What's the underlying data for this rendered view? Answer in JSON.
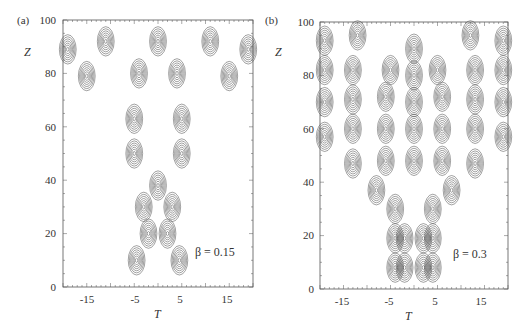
{
  "chart_data": [
    {
      "type": "contour",
      "panel_label": "(a)",
      "title": "",
      "xlabel": "T",
      "ylabel": "Z",
      "xlim": [
        -20,
        20
      ],
      "ylim": [
        0,
        100
      ],
      "xticks": [
        -15,
        -5,
        5,
        15
      ],
      "yticks": [
        0,
        20,
        40,
        60,
        80,
        100
      ],
      "grid": false,
      "annotation": "β = 0.15",
      "notes": "No contour levels or colorbar are shown. Peak locations below are approximate visual estimates; the underlying field values are not readable from the image.",
      "peaks_estimated": [
        {
          "T": -4.5,
          "Z": 10
        },
        {
          "T": -2,
          "Z": 20
        },
        {
          "T": 2,
          "Z": 20
        },
        {
          "T": 4.5,
          "Z": 10
        },
        {
          "T": -3,
          "Z": 30
        },
        {
          "T": 3,
          "Z": 30
        },
        {
          "T": 0,
          "Z": 38
        },
        {
          "T": -5,
          "Z": 50
        },
        {
          "T": 5,
          "Z": 50
        },
        {
          "T": -5,
          "Z": 63
        },
        {
          "T": 5,
          "Z": 63
        },
        {
          "T": -4,
          "Z": 80
        },
        {
          "T": 4,
          "Z": 80
        },
        {
          "T": -15,
          "Z": 79
        },
        {
          "T": 15,
          "Z": 79
        },
        {
          "T": -11,
          "Z": 92
        },
        {
          "T": 11,
          "Z": 92
        },
        {
          "T": 0,
          "Z": 92
        },
        {
          "T": -19,
          "Z": 89
        },
        {
          "T": 19,
          "Z": 89
        }
      ]
    },
    {
      "type": "contour",
      "panel_label": "(b)",
      "title": "",
      "xlabel": "T",
      "ylabel": "Z",
      "xlim": [
        -20,
        20
      ],
      "ylim": [
        0,
        100
      ],
      "xticks": [
        -15,
        -5,
        5,
        15
      ],
      "yticks": [
        0,
        20,
        40,
        60,
        80,
        100
      ],
      "grid": false,
      "annotation": "β = 0.3",
      "notes": "No contour levels or colorbar are shown. Peak locations below are approximate visual estimates; the underlying field values are not readable from the image.",
      "peaks_estimated": [
        {
          "T": -4,
          "Z": 8
        },
        {
          "T": -2,
          "Z": 8
        },
        {
          "T": 2,
          "Z": 8
        },
        {
          "T": 4,
          "Z": 8
        },
        {
          "T": -4,
          "Z": 19
        },
        {
          "T": -2,
          "Z": 19
        },
        {
          "T": 2,
          "Z": 19
        },
        {
          "T": 4,
          "Z": 19
        },
        {
          "T": -4,
          "Z": 30
        },
        {
          "T": 4,
          "Z": 30
        },
        {
          "T": -8,
          "Z": 37
        },
        {
          "T": 8,
          "Z": 37
        },
        {
          "T": 0,
          "Z": 48
        },
        {
          "T": 0,
          "Z": 60
        },
        {
          "T": 0,
          "Z": 70
        },
        {
          "T": 0,
          "Z": 80
        },
        {
          "T": 0,
          "Z": 90
        },
        {
          "T": -6,
          "Z": 48
        },
        {
          "T": 6,
          "Z": 48
        },
        {
          "T": -6,
          "Z": 60
        },
        {
          "T": 6,
          "Z": 60
        },
        {
          "T": -6,
          "Z": 72
        },
        {
          "T": 6,
          "Z": 72
        },
        {
          "T": -5,
          "Z": 82
        },
        {
          "T": 5,
          "Z": 82
        },
        {
          "T": -13,
          "Z": 47
        },
        {
          "T": 13,
          "Z": 47
        },
        {
          "T": -13,
          "Z": 60
        },
        {
          "T": 13,
          "Z": 60
        },
        {
          "T": -13,
          "Z": 71
        },
        {
          "T": 13,
          "Z": 71
        },
        {
          "T": -13,
          "Z": 82
        },
        {
          "T": 13,
          "Z": 82
        },
        {
          "T": -19,
          "Z": 57
        },
        {
          "T": 19,
          "Z": 57
        },
        {
          "T": -19,
          "Z": 70
        },
        {
          "T": 19,
          "Z": 70
        },
        {
          "T": -19,
          "Z": 82
        },
        {
          "T": 19,
          "Z": 82
        },
        {
          "T": -19,
          "Z": 93
        },
        {
          "T": 19,
          "Z": 93
        },
        {
          "T": -12,
          "Z": 95
        },
        {
          "T": 12,
          "Z": 95
        }
      ]
    }
  ],
  "panels": [
    {
      "label": "(a)",
      "xlabel": "T",
      "ylabel": "Z",
      "annotation": "β = 0.15",
      "xticks": [
        "-15",
        "-5",
        "5",
        "15"
      ],
      "yticks": [
        "0",
        "20",
        "40",
        "60",
        "80",
        "100"
      ]
    },
    {
      "label": "(b)",
      "xlabel": "T",
      "ylabel": "Z",
      "annotation": "β = 0.3",
      "xticks": [
        "-15",
        "-5",
        "5",
        "15"
      ],
      "yticks": [
        "0",
        "20",
        "40",
        "60",
        "80",
        "100"
      ]
    }
  ]
}
